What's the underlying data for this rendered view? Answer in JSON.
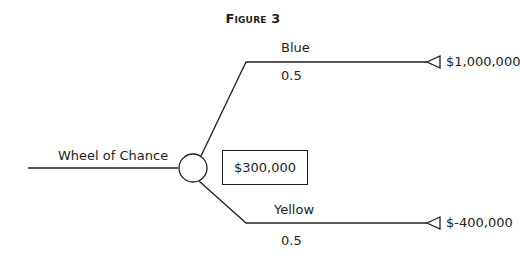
{
  "figure": {
    "title": "Figure 3"
  },
  "tree": {
    "root_label": "Wheel of Chance",
    "expected_value": "$300,000",
    "chance_node": "circle",
    "branches": [
      {
        "label": "Blue",
        "probability": "0.5",
        "payoff": "$1,000,000",
        "terminal": "triangle"
      },
      {
        "label": "Yellow",
        "probability": "0.5",
        "payoff": "$-400,000",
        "terminal": "triangle"
      }
    ]
  },
  "colors": {
    "line": "#231f20",
    "background": "#ffffff"
  }
}
